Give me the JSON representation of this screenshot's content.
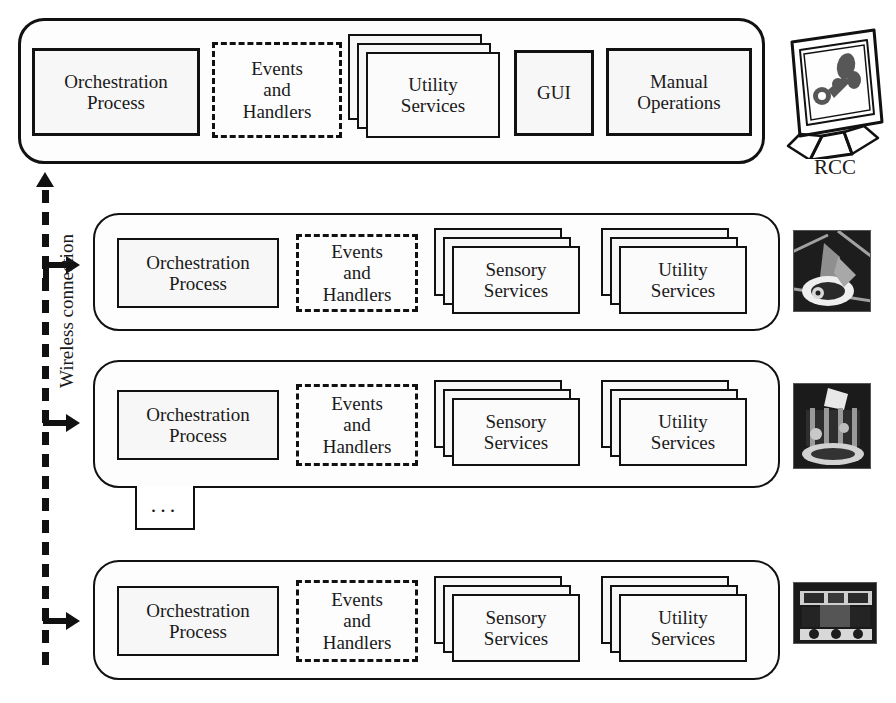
{
  "diagram": {
    "bus": {
      "label": "Wireless connection",
      "type": "dashed-bidirectional-bus"
    },
    "rcc": {
      "label": "RCC",
      "icon": "computer-monitor-icon",
      "blocks": [
        {
          "name": "orchestration-process",
          "label": "Orchestration\nProcess",
          "style": "solid",
          "stacked": false
        },
        {
          "name": "events-and-handlers",
          "label": "Events\nand\nHandlers",
          "style": "dashed",
          "stacked": false
        },
        {
          "name": "utility-services",
          "label": "Utility\nServices",
          "style": "solid",
          "stacked": true
        },
        {
          "name": "gui",
          "label": "GUI",
          "style": "solid",
          "stacked": false
        },
        {
          "name": "manual-operations",
          "label": "Manual\nOperations",
          "style": "solid",
          "stacked": false
        }
      ]
    },
    "robots": [
      {
        "name": "robot-node-1",
        "icon": "robot-photo-1",
        "blocks": [
          {
            "name": "orchestration-process",
            "label": "Orchestration\nProcess",
            "style": "solid",
            "stacked": false
          },
          {
            "name": "events-and-handlers",
            "label": "Events\nand\nHandlers",
            "style": "dashed",
            "stacked": false
          },
          {
            "name": "sensory-services",
            "label": "Sensory\nServices",
            "style": "solid",
            "stacked": true
          },
          {
            "name": "utility-services",
            "label": "Utility\nServices",
            "style": "solid",
            "stacked": true
          }
        ]
      },
      {
        "name": "robot-node-2",
        "icon": "robot-photo-2",
        "blocks": [
          {
            "name": "orchestration-process",
            "label": "Orchestration\nProcess",
            "style": "solid",
            "stacked": false
          },
          {
            "name": "events-and-handlers",
            "label": "Events\nand\nHandlers",
            "style": "dashed",
            "stacked": false
          },
          {
            "name": "sensory-services",
            "label": "Sensory\nServices",
            "style": "solid",
            "stacked": true
          },
          {
            "name": "utility-services",
            "label": "Utility\nServices",
            "style": "solid",
            "stacked": true
          }
        ]
      },
      {
        "name": "robot-node-n",
        "icon": "robot-photo-3",
        "blocks": [
          {
            "name": "orchestration-process",
            "label": "Orchestration\nProcess",
            "style": "solid",
            "stacked": false
          },
          {
            "name": "events-and-handlers",
            "label": "Events\nand\nHandlers",
            "style": "dashed",
            "stacked": false
          },
          {
            "name": "sensory-services",
            "label": "Sensory\nServices",
            "style": "solid",
            "stacked": true
          },
          {
            "name": "utility-services",
            "label": "Utility\nServices",
            "style": "solid",
            "stacked": true
          }
        ]
      }
    ],
    "continuation": {
      "label": "...",
      "name": "more-robots-indicator"
    },
    "colors": {
      "stroke": "#111111",
      "box_fill": "#f7f7f7",
      "panel_fill": "#fdfdfd",
      "background": "#ffffff"
    }
  }
}
